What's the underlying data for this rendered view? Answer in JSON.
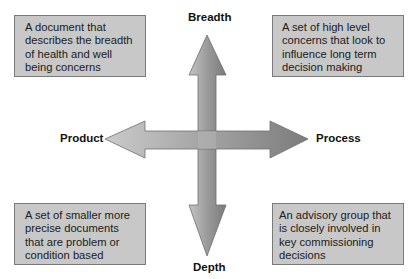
{
  "diagram": {
    "axes": {
      "top": "Breadth",
      "bottom": "Depth",
      "left": "Product",
      "right": "Process"
    },
    "quadrants": {
      "top_left": "A document that describes the breadth of health and well being concerns",
      "top_right": "A set of high level concerns that look to influence long term decision making",
      "bottom_left": "A set of smaller more precise documents that are problem or condition based",
      "bottom_right": "An advisory group that is closely involved in key commissioning decisions"
    },
    "colors": {
      "box_fill": "#c8c8c8",
      "box_border": "#7a7a7a",
      "arrow_light": "#c4c4c4",
      "arrow_dark": "#7e7e7e"
    }
  }
}
